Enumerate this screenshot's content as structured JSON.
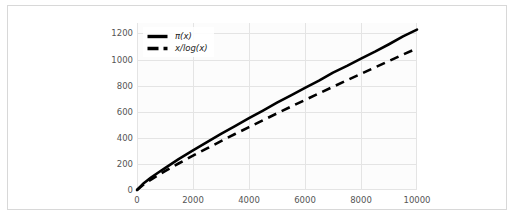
{
  "figure": {
    "background_color": "#ffffff",
    "frame_border_color": "#d8d8d8",
    "plot_background_color": "#fcfcfc",
    "grid_color": "#e4e4e4",
    "line_color": "#000000"
  },
  "legend": {
    "position": "upper-left",
    "entries": [
      {
        "label": "π(x)",
        "style": "solid",
        "swatch_name": "legend-swatch-solid"
      },
      {
        "label": "x/log(x)",
        "style": "dashed",
        "swatch_name": "legend-swatch-dashed"
      }
    ]
  },
  "chart_data": {
    "type": "line",
    "title": "",
    "xlabel": "",
    "ylabel": "",
    "xlim": [
      0,
      10000
    ],
    "ylim": [
      0,
      1280
    ],
    "grid": true,
    "legend_position": "upper left",
    "xticks": [
      0,
      2000,
      4000,
      6000,
      8000,
      10000
    ],
    "xtick_labels": [
      "0",
      "2000",
      "4000",
      "6000",
      "8000",
      "10000"
    ],
    "yticks": [
      0,
      200,
      400,
      600,
      800,
      1000,
      1200
    ],
    "ytick_labels": [
      "0",
      "200",
      "400",
      "600",
      "800",
      "1000",
      "1200"
    ],
    "x": [
      0,
      250,
      500,
      750,
      1000,
      1500,
      2000,
      2500,
      3000,
      3500,
      4000,
      4500,
      5000,
      5500,
      6000,
      6500,
      7000,
      7500,
      8000,
      8500,
      9000,
      9500,
      10000
    ],
    "series": [
      {
        "name": "π(x)",
        "style": "solid",
        "color": "#000000",
        "values": [
          0,
          54,
          95,
          132,
          168,
          239,
          303,
          367,
          430,
          489,
          550,
          609,
          669,
          726,
          783,
          838,
          900,
          951,
          1007,
          1060,
          1117,
          1177,
          1229
        ]
      },
      {
        "name": "x/log(x)",
        "style": "dashed",
        "color": "#000000",
        "values": [
          0,
          45,
          80,
          113,
          145,
          205,
          263,
          319,
          374,
          429,
          482,
          535,
          587,
          639,
          690,
          741,
          791,
          841,
          890,
          940,
          989,
          1038,
          1086
        ]
      }
    ]
  }
}
